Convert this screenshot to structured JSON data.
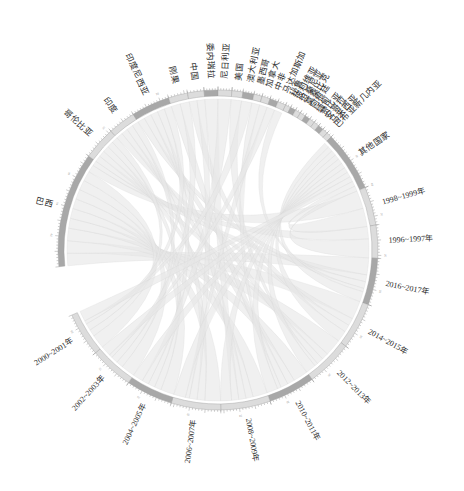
{
  "figure": {
    "type": "chord-diagram",
    "background": "#ffffff",
    "ribbon_color": "#e6e6e6",
    "ribbon_stroke": "#d2d2d2",
    "arc_color_light": "#dcdcdc",
    "arc_color_dark": "#a8a8a8",
    "axis_color": "#8e8e8e",
    "center": {
      "x": 218,
      "y": 250
    },
    "radius": 160
  },
  "chart_data": {
    "type": "chord",
    "title": "",
    "xlabel": "",
    "ylabel": "",
    "legend": [],
    "groups": [
      {
        "label": "巴西",
        "kind": "country",
        "value": 44,
        "start_angle": 174,
        "end_angle": 216
      },
      {
        "label": "哥伦比亚",
        "kind": "country",
        "value": 12,
        "start_angle": 216,
        "end_angle": 228
      },
      {
        "label": "印度",
        "kind": "country",
        "value": 10,
        "start_angle": 228,
        "end_angle": 238
      },
      {
        "label": "印度尼西亚",
        "kind": "country",
        "value": 14,
        "start_angle": 238,
        "end_angle": 252
      },
      {
        "label": "刚果",
        "kind": "country",
        "value": 7,
        "start_angle": 252,
        "end_angle": 259
      },
      {
        "label": "中国",
        "kind": "country",
        "value": 6,
        "start_angle": 259,
        "end_angle": 265
      },
      {
        "label": "委内瑞拉",
        "kind": "country",
        "value": 5,
        "start_angle": 265,
        "end_angle": 270
      },
      {
        "label": "尼日利亚",
        "kind": "country",
        "value": 5,
        "start_angle": 270,
        "end_angle": 275
      },
      {
        "label": "美国",
        "kind": "country",
        "value": 4,
        "start_angle": 275,
        "end_angle": 279
      },
      {
        "label": "澳大利亚",
        "kind": "country",
        "value": 4,
        "start_angle": 279,
        "end_angle": 283
      },
      {
        "label": "墨西哥",
        "kind": "country",
        "value": 3,
        "start_angle": 283,
        "end_angle": 286
      },
      {
        "label": "加拿大",
        "kind": "country",
        "value": 3,
        "start_angle": 286,
        "end_angle": 289
      },
      {
        "label": "中非",
        "kind": "country",
        "value": 3,
        "start_angle": 289,
        "end_angle": 292
      },
      {
        "label": "马达加斯加",
        "kind": "country",
        "value": 3,
        "start_angle": 292,
        "end_angle": 295
      },
      {
        "label": "秘鲁",
        "kind": "country",
        "value": 2,
        "start_angle": 295,
        "end_angle": 297
      },
      {
        "label": "玻利维亚",
        "kind": "country",
        "value": 2,
        "start_angle": 297,
        "end_angle": 299
      },
      {
        "label": "坦桑尼亚",
        "kind": "country",
        "value": 2,
        "start_angle": 299,
        "end_angle": 301
      },
      {
        "label": "莫桑比克",
        "kind": "country",
        "value": 2,
        "start_angle": 301,
        "end_angle": 303
      },
      {
        "label": "阿根廷",
        "kind": "country",
        "value": 2,
        "start_angle": 303,
        "end_angle": 305
      },
      {
        "label": "缅甸",
        "kind": "country",
        "value": 2,
        "start_angle": 305,
        "end_angle": 307
      },
      {
        "label": "赞比亚",
        "kind": "country",
        "value": 2,
        "start_angle": 307,
        "end_angle": 309
      },
      {
        "label": "安哥拉",
        "kind": "country",
        "value": 2,
        "start_angle": 309,
        "end_angle": 311
      },
      {
        "label": "马来西亚",
        "kind": "country",
        "value": 2,
        "start_angle": 311,
        "end_angle": 313
      },
      {
        "label": "巴布亚新几内亚",
        "kind": "country",
        "value": 2,
        "start_angle": 313,
        "end_angle": 315
      },
      {
        "label": "其他国家",
        "kind": "country",
        "value": 22,
        "start_angle": 315,
        "end_angle": 337
      },
      {
        "label": "1998~1999年",
        "kind": "period",
        "value": 14,
        "start_angle": 337,
        "end_angle": 351
      },
      {
        "label": "1996~1997年",
        "kind": "period",
        "value": 12,
        "start_angle": 351,
        "end_angle": 363
      },
      {
        "label": "2016~2017年",
        "kind": "period",
        "value": 17,
        "start_angle": 363,
        "end_angle": 380
      },
      {
        "label": "2014~2015年",
        "kind": "period",
        "value": 17,
        "start_angle": 380,
        "end_angle": 397
      },
      {
        "label": "2012~2013年",
        "kind": "period",
        "value": 17,
        "start_angle": 397,
        "end_angle": 414
      },
      {
        "label": "2010~2011年",
        "kind": "period",
        "value": 17,
        "start_angle": 414,
        "end_angle": 431
      },
      {
        "label": "2008~2009年",
        "kind": "period",
        "value": 18,
        "start_angle": 431,
        "end_angle": 449
      },
      {
        "label": "2006~2007年",
        "kind": "period",
        "value": 18,
        "start_angle": 449,
        "end_angle": 467
      },
      {
        "label": "2004~2005年",
        "kind": "period",
        "value": 17,
        "start_angle": 467,
        "end_angle": 484
      },
      {
        "label": "2002~2003年",
        "kind": "period",
        "value": 16,
        "start_angle": 484,
        "end_angle": 500
      },
      {
        "label": "2000~2001年",
        "kind": "period",
        "value": 16,
        "start_angle": 500,
        "end_angle": 516
      }
    ],
    "axis_ticks": {
      "step": 2,
      "minor_per_major": 5,
      "label_every": 10
    },
    "chords": [
      {
        "source": "巴西",
        "target": "2016~2017年",
        "value": 5
      },
      {
        "source": "巴西",
        "target": "2014~2015年",
        "value": 5
      },
      {
        "source": "巴西",
        "target": "2012~2013年",
        "value": 5
      },
      {
        "source": "巴西",
        "target": "2010~2011年",
        "value": 4
      },
      {
        "source": "巴西",
        "target": "2008~2009年",
        "value": 4
      },
      {
        "source": "巴西",
        "target": "2006~2007年",
        "value": 4
      },
      {
        "source": "巴西",
        "target": "2004~2005年",
        "value": 4
      },
      {
        "source": "巴西",
        "target": "2002~2003年",
        "value": 4
      },
      {
        "source": "巴西",
        "target": "2000~2001年",
        "value": 4
      },
      {
        "source": "巴西",
        "target": "1998~1999年",
        "value": 3
      },
      {
        "source": "巴西",
        "target": "1996~1997年",
        "value": 2
      },
      {
        "source": "哥伦比亚",
        "target": "2016~2017年",
        "value": 2
      },
      {
        "source": "哥伦比亚",
        "target": "2012~2013年",
        "value": 2
      },
      {
        "source": "哥伦比亚",
        "target": "2008~2009年",
        "value": 2
      },
      {
        "source": "哥伦比亚",
        "target": "2004~2005年",
        "value": 2
      },
      {
        "source": "哥伦比亚",
        "target": "2000~2001年",
        "value": 2
      },
      {
        "source": "印度",
        "target": "2014~2015年",
        "value": 2
      },
      {
        "source": "印度",
        "target": "2010~2011年",
        "value": 2
      },
      {
        "source": "印度",
        "target": "2006~2007年",
        "value": 2
      },
      {
        "source": "印度",
        "target": "2002~2003年",
        "value": 2
      },
      {
        "source": "印度尼西亚",
        "target": "2016~2017年",
        "value": 2
      },
      {
        "source": "印度尼西亚",
        "target": "2012~2013年",
        "value": 2
      },
      {
        "source": "印度尼西亚",
        "target": "2008~2009年",
        "value": 2
      },
      {
        "source": "印度尼西亚",
        "target": "2004~2005年",
        "value": 2
      },
      {
        "source": "印度尼西亚",
        "target": "2000~2001年",
        "value": 2
      },
      {
        "source": "刚果",
        "target": "2010~2011年",
        "value": 2
      },
      {
        "source": "刚果",
        "target": "2002~2003年",
        "value": 2
      },
      {
        "source": "中国",
        "target": "2014~2015年",
        "value": 2
      },
      {
        "source": "中国",
        "target": "2006~2007年",
        "value": 2
      },
      {
        "source": "委内瑞拉",
        "target": "2008~2009年",
        "value": 2
      },
      {
        "source": "尼日利亚",
        "target": "2004~2005年",
        "value": 2
      },
      {
        "source": "美国",
        "target": "2012~2013年",
        "value": 1
      },
      {
        "source": "澳大利亚",
        "target": "2000~2001年",
        "value": 1
      },
      {
        "source": "墨西哥",
        "target": "2010~2011年",
        "value": 1
      },
      {
        "source": "加拿大",
        "target": "2006~2007年",
        "value": 1
      },
      {
        "source": "中非",
        "target": "2002~2003年",
        "value": 1
      },
      {
        "source": "马达加斯加",
        "target": "2016~2017年",
        "value": 1
      },
      {
        "source": "其他国家",
        "target": "2016~2017年",
        "value": 3
      },
      {
        "source": "其他国家",
        "target": "2014~2015年",
        "value": 3
      },
      {
        "source": "其他国家",
        "target": "2012~2013年",
        "value": 3
      },
      {
        "source": "其他国家",
        "target": "2010~2011年",
        "value": 3
      },
      {
        "source": "其他国家",
        "target": "2008~2009年",
        "value": 3
      },
      {
        "source": "其他国家",
        "target": "2006~2007年",
        "value": 3
      },
      {
        "source": "其他国家",
        "target": "2004~2005年",
        "value": 3
      },
      {
        "source": "其他国家",
        "target": "2002~2003年",
        "value": 3
      },
      {
        "source": "其他国家",
        "target": "2000~2001年",
        "value": 3
      },
      {
        "source": "其他国家",
        "target": "1998~1999年",
        "value": 3
      },
      {
        "source": "其他国家",
        "target": "1996~1997年",
        "value": 3
      }
    ]
  }
}
